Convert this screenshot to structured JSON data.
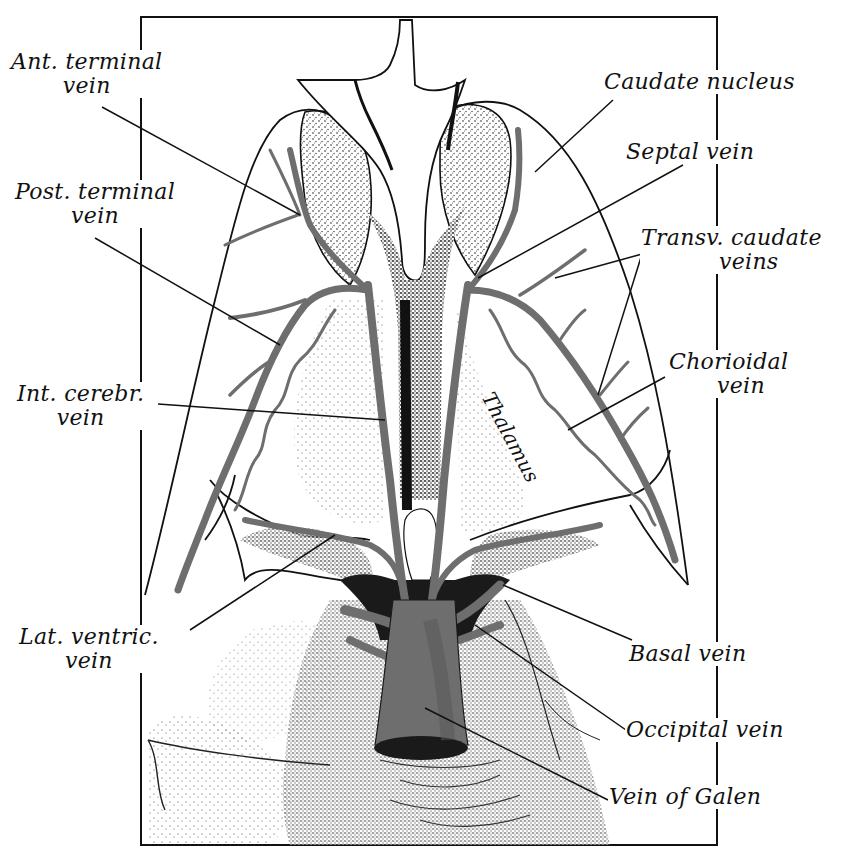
{
  "figure": {
    "colors": {
      "ink": "#111111",
      "vein": "#6e6e6e",
      "stipple": "#3a3a3a",
      "paper": "#ffffff",
      "dark_recess": "#1a1a1a"
    },
    "frame": {
      "x": 141,
      "y": 17,
      "w": 576,
      "h": 828
    }
  },
  "labels": {
    "ant_terminal_vein": {
      "line1": "Ant. terminal",
      "line2": "vein",
      "x": 10,
      "y": 50,
      "align": "center"
    },
    "post_terminal_vein": {
      "line1": "Post. terminal",
      "line2": "vein",
      "x": 14,
      "y": 180,
      "align": "center"
    },
    "int_cerebr_vein": {
      "line1": "Int. cerebr.",
      "line2": "vein",
      "x": 20,
      "y": 382,
      "align": "center"
    },
    "lat_ventric_vein": {
      "line1": "Lat. ventric.",
      "line2": "vein",
      "x": 20,
      "y": 625,
      "align": "center"
    },
    "caudate_nucleus": {
      "line1": "Caudate nucleus",
      "x": 603,
      "y": 70,
      "align": "left"
    },
    "septal_vein": {
      "line1": "Septal vein",
      "x": 625,
      "y": 140,
      "align": "left"
    },
    "transv_caudate_veins": {
      "line1": "Transv. caudate",
      "line2": "veins",
      "x": 640,
      "y": 226,
      "align": "left",
      "indent2": 78
    },
    "chorioidal_vein": {
      "line1": "Chorioidal",
      "line2": "vein",
      "x": 668,
      "y": 350,
      "align": "left",
      "indent2": 48
    },
    "basal_vein": {
      "line1": "Basal vein",
      "x": 628,
      "y": 642,
      "align": "left"
    },
    "occipital_vein": {
      "line1": "Occipital vein",
      "x": 625,
      "y": 718,
      "align": "left"
    },
    "vein_of_galen": {
      "line1": "Vein of Galen",
      "x": 608,
      "y": 785,
      "align": "left"
    },
    "thalamus": {
      "text": "Thalamus",
      "x": 498,
      "y": 388,
      "rotate": 62
    }
  },
  "leader_lines": [
    {
      "name": "ant-terminal-vein-leader",
      "x1": 102,
      "y1": 107,
      "x2": 300,
      "y2": 215
    },
    {
      "name": "post-terminal-vein-leader",
      "x1": 95,
      "y1": 238,
      "x2": 280,
      "y2": 345
    },
    {
      "name": "int-cerebr-vein-leader",
      "x1": 158,
      "y1": 404,
      "x2": 385,
      "y2": 420
    },
    {
      "name": "lat-ventric-vein-leader",
      "x1": 190,
      "y1": 630,
      "x2": 335,
      "y2": 535
    },
    {
      "name": "caudate-nucleus-leader",
      "x1": 613,
      "y1": 100,
      "x2": 535,
      "y2": 172
    },
    {
      "name": "septal-vein-leader",
      "x1": 683,
      "y1": 165,
      "x2": 478,
      "y2": 278
    },
    {
      "name": "transv-caudate-leader-a",
      "x1": 642,
      "y1": 254,
      "x2": 555,
      "y2": 278
    },
    {
      "name": "transv-caudate-leader-b",
      "x1": 642,
      "y1": 254,
      "x2": 598,
      "y2": 395
    },
    {
      "name": "chorioidal-vein-leader",
      "x1": 665,
      "y1": 377,
      "x2": 568,
      "y2": 430
    },
    {
      "name": "basal-vein-leader",
      "x1": 632,
      "y1": 640,
      "x2": 503,
      "y2": 585
    },
    {
      "name": "occipital-vein-leader",
      "x1": 626,
      "y1": 730,
      "x2": 475,
      "y2": 625
    },
    {
      "name": "vein-of-galen-leader",
      "x1": 608,
      "y1": 800,
      "x2": 425,
      "y2": 708
    }
  ]
}
